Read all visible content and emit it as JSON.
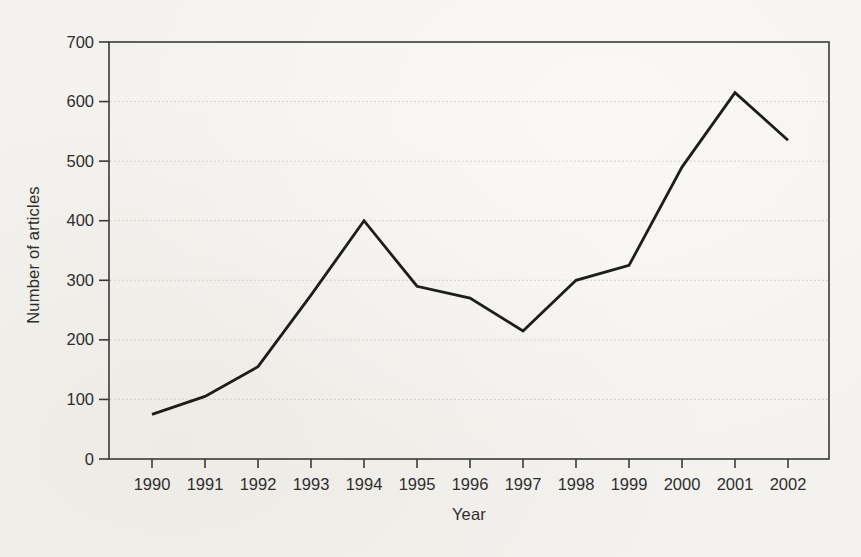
{
  "chart_data": {
    "type": "line",
    "title": "",
    "xlabel": "Year",
    "ylabel": "Number of articles",
    "x": [
      1990,
      1991,
      1992,
      1993,
      1994,
      1995,
      1996,
      1997,
      1998,
      1999,
      2000,
      2001,
      2002
    ],
    "values": [
      75,
      105,
      155,
      275,
      400,
      290,
      270,
      215,
      300,
      325,
      490,
      615,
      535
    ],
    "ylim": [
      0,
      700
    ],
    "ytick_step": 100,
    "yticks": [
      0,
      100,
      200,
      300,
      400,
      500,
      600,
      700
    ],
    "grid": "horizontal-dashed",
    "legend": "none",
    "frame": true
  },
  "colors": {
    "line": "#1d1d1d",
    "axis": "#3a3a3a",
    "grid": "#c9c7c1",
    "text": "#2e2e2e",
    "background": "#f4f2ee"
  }
}
